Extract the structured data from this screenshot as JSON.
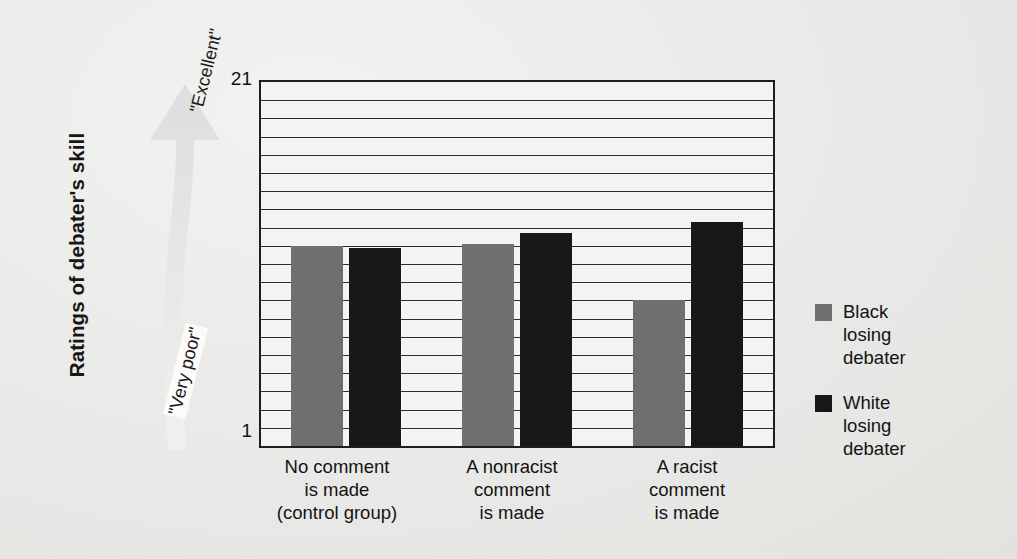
{
  "figure": {
    "y_axis_title": "Ratings of debater's skill",
    "scale_top_label": "21",
    "scale_bottom_label": "1",
    "arrow_top_text": "\"Excellent\"",
    "arrow_bottom_text": "\"Very poor\"",
    "arrow_icon": "up-arrow-icon"
  },
  "legend": {
    "items": [
      {
        "label_line1": "Black",
        "label_line2": "losing",
        "label_line3": "debater",
        "color": "#6f6f6f",
        "swatch_icon": "legend-swatch-gray"
      },
      {
        "label_line1": "White",
        "label_line2": "losing",
        "label_line3": "debater",
        "color": "#171717",
        "swatch_icon": "legend-swatch-black"
      }
    ]
  },
  "categories": [
    {
      "line1": "No comment",
      "line2": "is made",
      "line3": "(control group)"
    },
    {
      "line1": "A nonracist",
      "line2": "comment",
      "line3": "is made"
    },
    {
      "line1": "A racist",
      "line2": "comment",
      "line3": "is made"
    }
  ],
  "chart_data": {
    "type": "bar",
    "title": "",
    "xlabel": "",
    "ylabel": "Ratings of debater's skill",
    "ylim": [
      1,
      21
    ],
    "ytick_labels": [
      "1",
      "21"
    ],
    "grid": true,
    "grid_interval": 1,
    "legend_position": "right",
    "categories": [
      "No comment is made (control group)",
      "A nonracist comment is made",
      "A racist comment is made"
    ],
    "series": [
      {
        "name": "Black losing debater",
        "color": "#6f6f6f",
        "values": [
          12.0,
          12.1,
          9.0
        ]
      },
      {
        "name": "White losing debater",
        "color": "#171717",
        "values": [
          11.9,
          12.7,
          13.3
        ]
      }
    ],
    "annotations": [
      {
        "text": "\"Excellent\"",
        "position": "axis-top"
      },
      {
        "text": "\"Very poor\"",
        "position": "axis-bottom"
      }
    ]
  }
}
